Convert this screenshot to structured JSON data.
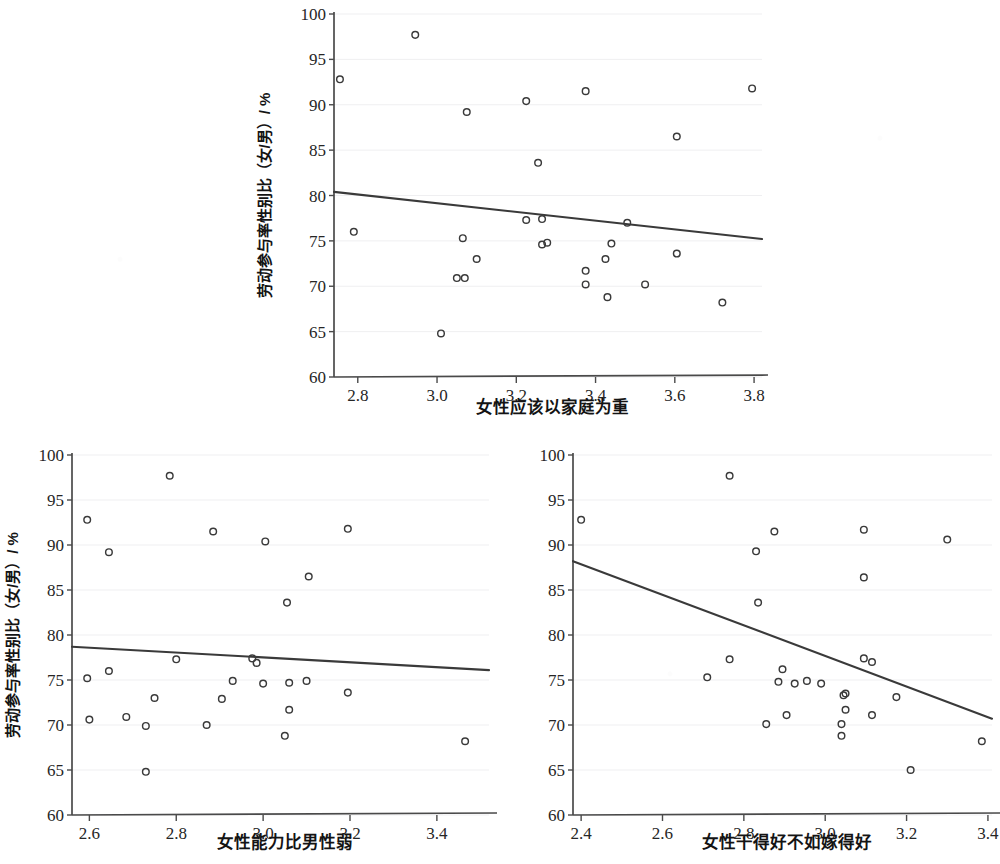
{
  "figure": {
    "shared_ylabel": "劳动参与率性别比（女/男）/ %",
    "marker": "open-circle",
    "line_color": "#3a3a3a",
    "grid_color": "#efeff1",
    "axis_color": "#4a4a4a"
  },
  "chart_data": [
    {
      "id": "top",
      "type": "scatter",
      "title": "",
      "xlabel": "女性应该以家庭为重",
      "ylabel": "劳动参与率性别比（女/男）/ %",
      "xlim": [
        2.74,
        3.82
      ],
      "ylim": [
        60,
        100
      ],
      "xticks": [
        2.8,
        3.0,
        3.2,
        3.4,
        3.6,
        3.8
      ],
      "xticklabels": [
        "2.8",
        "3.0",
        "3.2",
        "3.4",
        "3.6",
        "3.8"
      ],
      "yticks": [
        60,
        65,
        70,
        75,
        80,
        85,
        90,
        95,
        100
      ],
      "yticklabels": [
        "60",
        "65",
        "70",
        "75",
        "80",
        "85",
        "90",
        "95",
        "100"
      ],
      "grid": true,
      "legend": "none",
      "points": [
        {
          "x": 2.755,
          "y": 92.8
        },
        {
          "x": 2.945,
          "y": 97.7
        },
        {
          "x": 3.075,
          "y": 89.2
        },
        {
          "x": 3.225,
          "y": 90.4
        },
        {
          "x": 3.255,
          "y": 83.6
        },
        {
          "x": 3.375,
          "y": 91.5
        },
        {
          "x": 3.605,
          "y": 86.5
        },
        {
          "x": 3.795,
          "y": 91.8
        },
        {
          "x": 2.79,
          "y": 76.0
        },
        {
          "x": 3.225,
          "y": 77.3
        },
        {
          "x": 3.265,
          "y": 77.4
        },
        {
          "x": 3.48,
          "y": 77.0
        },
        {
          "x": 3.065,
          "y": 75.3
        },
        {
          "x": 3.265,
          "y": 74.6
        },
        {
          "x": 3.278,
          "y": 74.8
        },
        {
          "x": 3.44,
          "y": 74.7
        },
        {
          "x": 3.1,
          "y": 73.0
        },
        {
          "x": 3.425,
          "y": 73.0
        },
        {
          "x": 3.605,
          "y": 73.6
        },
        {
          "x": 3.375,
          "y": 71.7
        },
        {
          "x": 3.05,
          "y": 70.9
        },
        {
          "x": 3.07,
          "y": 70.9
        },
        {
          "x": 3.375,
          "y": 70.2
        },
        {
          "x": 3.525,
          "y": 70.2
        },
        {
          "x": 3.43,
          "y": 68.8
        },
        {
          "x": 3.72,
          "y": 68.2
        },
        {
          "x": 3.01,
          "y": 64.8
        }
      ],
      "fit_line": {
        "x0": 2.74,
        "y0": 80.4,
        "x1": 3.82,
        "y1": 75.2,
        "slope": -4.8
      }
    },
    {
      "id": "bottom-left",
      "type": "scatter",
      "title": "",
      "xlabel": "女性能力比男性弱",
      "ylabel": "劳动参与率性别比（女/男）/ %",
      "xlim": [
        2.56,
        3.52
      ],
      "ylim": [
        60,
        100
      ],
      "xticks": [
        2.6,
        2.8,
        3.0,
        3.2,
        3.4
      ],
      "xticklabels": [
        "2.6",
        "2.8",
        "3.0",
        "3.2",
        "3.4"
      ],
      "yticks": [
        60,
        65,
        70,
        75,
        80,
        85,
        90,
        95,
        100
      ],
      "yticklabels": [
        "60",
        "65",
        "70",
        "75",
        "80",
        "85",
        "90",
        "95",
        "100"
      ],
      "grid": true,
      "legend": "none",
      "points": [
        {
          "x": 2.595,
          "y": 92.8
        },
        {
          "x": 2.645,
          "y": 89.2
        },
        {
          "x": 2.785,
          "y": 97.7
        },
        {
          "x": 2.885,
          "y": 91.5
        },
        {
          "x": 3.005,
          "y": 90.4
        },
        {
          "x": 3.055,
          "y": 83.6
        },
        {
          "x": 3.105,
          "y": 86.5
        },
        {
          "x": 3.195,
          "y": 91.8
        },
        {
          "x": 2.8,
          "y": 77.3
        },
        {
          "x": 2.975,
          "y": 77.4
        },
        {
          "x": 2.985,
          "y": 76.9
        },
        {
          "x": 2.645,
          "y": 76.0
        },
        {
          "x": 2.595,
          "y": 75.2
        },
        {
          "x": 2.93,
          "y": 74.9
        },
        {
          "x": 3.0,
          "y": 74.6
        },
        {
          "x": 3.06,
          "y": 74.7
        },
        {
          "x": 3.1,
          "y": 74.9
        },
        {
          "x": 2.75,
          "y": 73.0
        },
        {
          "x": 2.905,
          "y": 72.9
        },
        {
          "x": 3.195,
          "y": 73.6
        },
        {
          "x": 3.06,
          "y": 71.7
        },
        {
          "x": 2.685,
          "y": 70.9
        },
        {
          "x": 2.73,
          "y": 69.9
        },
        {
          "x": 2.87,
          "y": 70.0
        },
        {
          "x": 2.6,
          "y": 70.6
        },
        {
          "x": 3.05,
          "y": 68.8
        },
        {
          "x": 3.465,
          "y": 68.2
        },
        {
          "x": 2.73,
          "y": 64.8
        }
      ],
      "fit_line": {
        "x0": 2.56,
        "y0": 78.7,
        "x1": 3.52,
        "y1": 76.1,
        "slope": -2.7
      }
    },
    {
      "id": "bottom-right",
      "type": "scatter",
      "title": "",
      "xlabel": "女性干得好不如嫁得好",
      "ylabel": "劳动参与率性别比（女/男）/ %",
      "xlim": [
        2.38,
        3.41
      ],
      "ylim": [
        60,
        100
      ],
      "xticks": [
        2.4,
        2.6,
        2.8,
        3.0,
        3.2,
        3.4
      ],
      "xticklabels": [
        "2.4",
        "2.6",
        "2.8",
        "3.0",
        "3.2",
        "3.4"
      ],
      "yticks": [
        60,
        65,
        70,
        75,
        80,
        85,
        90,
        95,
        100
      ],
      "yticklabels": [
        "60",
        "65",
        "70",
        "75",
        "80",
        "85",
        "90",
        "95",
        "100"
      ],
      "grid": true,
      "legend": "none",
      "points": [
        {
          "x": 2.4,
          "y": 92.8
        },
        {
          "x": 2.765,
          "y": 97.7
        },
        {
          "x": 2.83,
          "y": 89.3
        },
        {
          "x": 2.875,
          "y": 91.5
        },
        {
          "x": 2.835,
          "y": 83.6
        },
        {
          "x": 3.095,
          "y": 91.7
        },
        {
          "x": 3.095,
          "y": 86.4
        },
        {
          "x": 3.3,
          "y": 90.6
        },
        {
          "x": 2.765,
          "y": 77.3
        },
        {
          "x": 3.095,
          "y": 77.4
        },
        {
          "x": 3.115,
          "y": 77.0
        },
        {
          "x": 2.895,
          "y": 76.2
        },
        {
          "x": 2.71,
          "y": 75.3
        },
        {
          "x": 2.885,
          "y": 74.8
        },
        {
          "x": 2.925,
          "y": 74.6
        },
        {
          "x": 2.955,
          "y": 74.9
        },
        {
          "x": 2.99,
          "y": 74.6
        },
        {
          "x": 3.045,
          "y": 73.3
        },
        {
          "x": 3.05,
          "y": 73.5
        },
        {
          "x": 3.175,
          "y": 73.1
        },
        {
          "x": 3.05,
          "y": 71.7
        },
        {
          "x": 2.905,
          "y": 71.1
        },
        {
          "x": 3.115,
          "y": 71.1
        },
        {
          "x": 2.855,
          "y": 70.1
        },
        {
          "x": 3.04,
          "y": 70.1
        },
        {
          "x": 3.04,
          "y": 68.8
        },
        {
          "x": 3.385,
          "y": 68.2
        },
        {
          "x": 3.21,
          "y": 65.0
        }
      ],
      "fit_line": {
        "x0": 2.38,
        "y0": 88.2,
        "x1": 3.41,
        "y1": 70.7,
        "slope": -17.0
      }
    }
  ]
}
